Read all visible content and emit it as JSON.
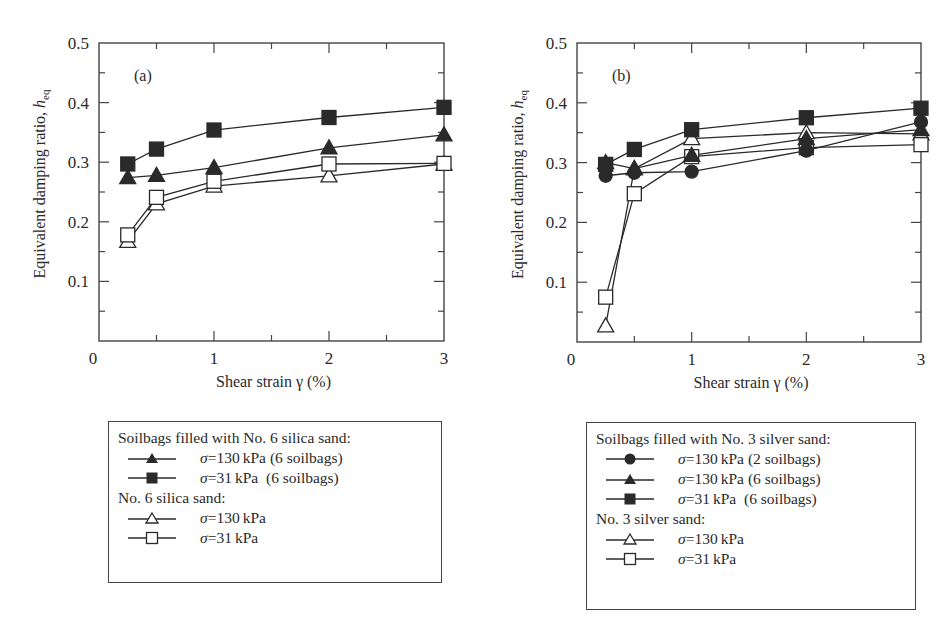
{
  "chart_data": [
    {
      "type": "line",
      "panel_label": "(a)",
      "xlabel": "Shear strain γ (%)",
      "ylabel": "Equivalent damping ratio, h_eq",
      "xlim": [
        0,
        3
      ],
      "ylim": [
        0,
        0.5
      ],
      "xticks": [
        "0",
        "1",
        "2",
        "3"
      ],
      "yticks": [
        "0.1",
        "0.2",
        "0.3",
        "0.4",
        "0.5"
      ],
      "grid": false,
      "x": [
        0.25,
        0.5,
        1,
        2,
        3
      ],
      "series": [
        {
          "name": "Soilbags filled with No. 6 silica sand: σ=130 kPa (6 soilbags)",
          "marker": "filled-triangle",
          "values": [
            0.274,
            0.278,
            0.291,
            0.324,
            0.346
          ]
        },
        {
          "name": "Soilbags filled with No. 6 silica sand: σ=31 kPa (6 soilbags)",
          "marker": "filled-square",
          "values": [
            0.297,
            0.322,
            0.354,
            0.375,
            0.392
          ]
        },
        {
          "name": "No. 6 silica sand: σ=130 kPa",
          "marker": "open-triangle",
          "values": [
            0.167,
            0.23,
            0.26,
            0.277,
            0.297
          ]
        },
        {
          "name": "No. 6 silica sand: σ=31 kPa",
          "marker": "open-square",
          "values": [
            0.178,
            0.241,
            0.268,
            0.297,
            0.298
          ]
        }
      ]
    },
    {
      "type": "line",
      "panel_label": "(b)",
      "xlabel": "Shear strain γ (%)",
      "ylabel": "Equivalent damping ratio, h_eq",
      "xlim": [
        0,
        3
      ],
      "ylim": [
        0,
        0.5
      ],
      "xticks": [
        "0",
        "1",
        "2",
        "3"
      ],
      "yticks": [
        "0.1",
        "0.2",
        "0.3",
        "0.4",
        "0.5"
      ],
      "grid": false,
      "x": [
        0.25,
        0.5,
        1,
        2,
        3
      ],
      "series": [
        {
          "name": "Soilbags filled with No. 3 silver sand: σ=130 kPa (2 soilbags)",
          "marker": "filled-circle",
          "values": [
            0.278,
            0.283,
            0.285,
            0.32,
            0.368
          ]
        },
        {
          "name": "Soilbags filled with No. 3 silver sand: σ=130 kPa (6 soilbags)",
          "marker": "filled-triangle",
          "values": [
            0.3,
            0.29,
            0.312,
            0.34,
            0.355
          ]
        },
        {
          "name": "Soilbags filled with No. 3 silver sand: σ=31 kPa (6 soilbags)",
          "marker": "filled-square",
          "values": [
            0.297,
            0.322,
            0.355,
            0.375,
            0.391
          ]
        },
        {
          "name": "No. 3 silver sand: σ=130 kPa",
          "marker": "open-triangle",
          "values": [
            0.027,
            0.29,
            0.34,
            0.35,
            0.348
          ]
        },
        {
          "name": "No. 3 silver sand: σ=31 kPa",
          "marker": "open-square",
          "values": [
            0.075,
            0.248,
            0.31,
            0.325,
            0.33
          ]
        }
      ]
    }
  ],
  "panels": {
    "a": {
      "label": "(a)",
      "xlabel": "Shear strain γ (%)",
      "ylabel_main": "Equivalent damping ratio, ",
      "ylabel_sym": "h",
      "ylabel_sub": "eq",
      "x_origin": "0",
      "legend": {
        "group1": "Soilbags filled with No. 6 silica sand:",
        "g1_rows": [
          {
            "sigma": "σ",
            "text": "=130 kPa (6 soilbags)"
          },
          {
            "sigma": "σ",
            "text": "=31 kPa  (6 soilbags)"
          }
        ],
        "group2": "No. 6 silica sand:",
        "g2_rows": [
          {
            "sigma": "σ",
            "text": "=130 kPa"
          },
          {
            "sigma": "σ",
            "text": "=31 kPa"
          }
        ]
      }
    },
    "b": {
      "label": "(b)",
      "xlabel": "Shear strain γ (%)",
      "ylabel_main": "Equivalent damping ratio, ",
      "ylabel_sym": "h",
      "ylabel_sub": "eq",
      "x_origin": "0",
      "legend": {
        "group1": "Soilbags filled with No. 3 silver sand:",
        "g1_rows": [
          {
            "sigma": "σ",
            "text": "=130 kPa (2 soilbags)"
          },
          {
            "sigma": "σ",
            "text": "=130 kPa (6 soilbags)"
          },
          {
            "sigma": "σ",
            "text": "=31 kPa  (6 soilbags)"
          }
        ],
        "group2": "No. 3 silver sand:",
        "g2_rows": [
          {
            "sigma": "σ",
            "text": "=130 kPa"
          },
          {
            "sigma": "σ",
            "text": "=31 kPa"
          }
        ]
      }
    }
  },
  "colors": {
    "ink": "#2a2a2a",
    "frame": "#444444",
    "fill": "#2a2a2a",
    "open_fill": "#ffffff"
  }
}
